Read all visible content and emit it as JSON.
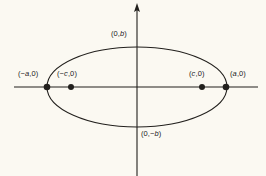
{
  "figure": {
    "name": "ellipse-foci-vertices-diagram",
    "background_color": "#fbf9f2",
    "stroke_color": "#22201d"
  },
  "chart_data": {
    "type": "scatter",
    "title": "",
    "xlabel": "",
    "ylabel": "",
    "grid": false,
    "legend": null,
    "axes": {
      "x_axis": {
        "visible": true,
        "arrow_start": false,
        "arrow_end": false
      },
      "y_axis": {
        "visible": true,
        "arrow_start": false,
        "arrow_end": true
      }
    },
    "curve": {
      "shape": "ellipse",
      "center": [
        0,
        0
      ],
      "semi_major_axis": "a",
      "semi_minor_axis": "b",
      "orientation": "horizontal"
    },
    "points": [
      {
        "id": "vertex-left",
        "label": "(−a,0)",
        "symbol": "dot",
        "role": "vertex"
      },
      {
        "id": "focus-left",
        "label": "(−c,0)",
        "symbol": "dot",
        "role": "focus"
      },
      {
        "id": "focus-right",
        "label": "(c,0)",
        "symbol": "dot",
        "role": "focus"
      },
      {
        "id": "vertex-right",
        "label": "(a,0)",
        "symbol": "dot",
        "role": "vertex"
      },
      {
        "id": "co-vertex-top",
        "label": "(0,b)",
        "symbol": "none",
        "role": "co-vertex"
      },
      {
        "id": "co-vertex-bottom",
        "label": "(0,−b)",
        "symbol": "none",
        "role": "co-vertex"
      }
    ],
    "labels": {
      "vertex_left": "(−a,0)",
      "focus_left": "(−c,0)",
      "focus_right": "(c,0)",
      "vertex_right": "(a,0)",
      "co_vertex_top": "(0,b)",
      "co_vertex_bottom": "(0,−b)"
    }
  }
}
